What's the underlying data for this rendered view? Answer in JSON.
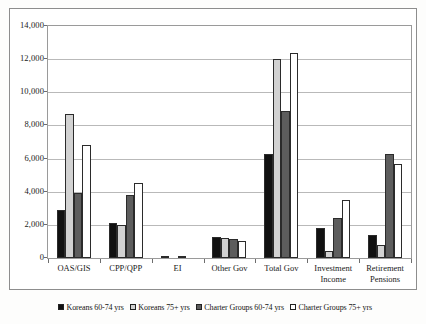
{
  "chart_data": {
    "type": "bar",
    "title": "",
    "subtitle": "",
    "xlabel": "",
    "ylabel": "",
    "ylim": [
      0,
      14000
    ],
    "ytick_step": 2000,
    "grid": true,
    "legend_position": "bottom",
    "categories": [
      "OAS/GIS",
      "CPP/QPP",
      "EI",
      "Other Gov",
      "Total Gov",
      "Investment Income",
      "Retirement Pensions"
    ],
    "ytick_labels": [
      "0",
      "2,000",
      "4,000",
      "6,000",
      "8,000",
      "10,000",
      "12,000",
      "14,000"
    ],
    "ytick_values": [
      0,
      2000,
      4000,
      6000,
      8000,
      10000,
      12000,
      14000
    ],
    "series": [
      {
        "name": "Koreans 60-74 yrs",
        "color": "#111111",
        "values": [
          2900,
          2100,
          50,
          1250,
          6300,
          1800,
          1400
        ]
      },
      {
        "name": "Koreans 75+ yrs",
        "color": "#d2d2d2",
        "values": [
          8700,
          2000,
          0,
          1200,
          12000,
          400,
          800
        ]
      },
      {
        "name": "Charter Groups 60-74 yrs",
        "color": "#5d5d5d",
        "values": [
          3900,
          3800,
          150,
          1150,
          8900,
          2400,
          6300
        ]
      },
      {
        "name": "Charter Groups 75+ yrs",
        "color": "#ffffff",
        "values": [
          6800,
          4500,
          0,
          1050,
          12400,
          3500,
          5700
        ]
      }
    ]
  },
  "legend": {
    "entries": [
      {
        "label": "Koreans 60-74 yrs"
      },
      {
        "label": "Koreans  75+ yrs"
      },
      {
        "label": "Charter Groups 60-74 yrs"
      },
      {
        "label": "Charter Groups 75+ yrs"
      }
    ]
  }
}
